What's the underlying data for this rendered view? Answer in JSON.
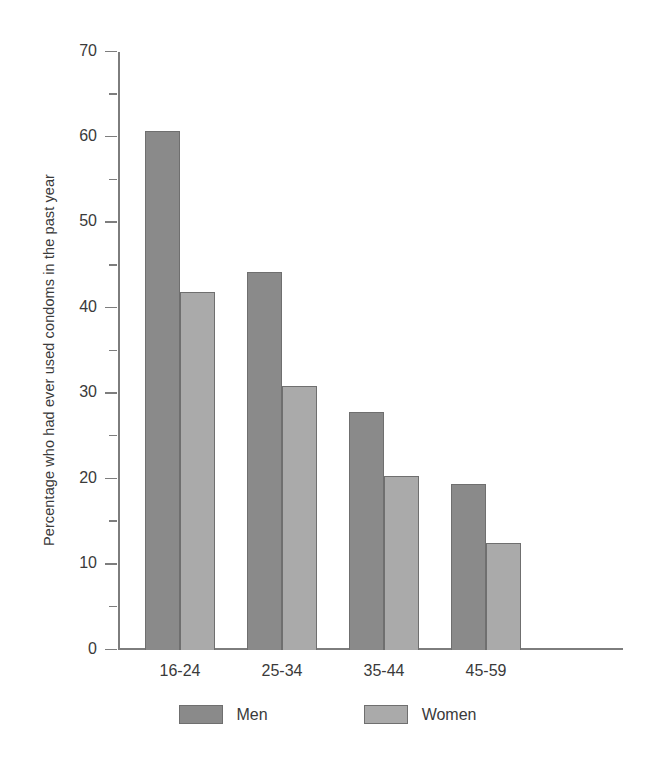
{
  "chart_data": {
    "type": "bar",
    "title": "",
    "subtitle": "",
    "xlabel": "",
    "ylabel": "Percentage who had ever used condoms in the past year",
    "ylim": [
      0,
      70
    ],
    "y_major_step": 10,
    "y_minor_step": 5,
    "grid": false,
    "legend_position": "bottom",
    "categories": [
      "16-24",
      "25-34",
      "35-44",
      "45-59",
      "All ages"
    ],
    "series": [
      {
        "name": "Men",
        "color": "#8a8a8a",
        "values": [
          60.8,
          44.3,
          27.9,
          19.4,
          36.6
        ]
      },
      {
        "name": "Women",
        "color": "#aaaaaa",
        "values": [
          41.9,
          30.9,
          20.4,
          12.5,
          25.6
        ]
      }
    ],
    "y_tick_labels": [
      "70",
      "60",
      "50",
      "40",
      "30",
      "20",
      "10",
      "0"
    ],
    "y_tick_values": [
      70,
      60,
      50,
      40,
      30,
      20,
      10,
      0
    ],
    "y_minor_tick_values": [
      65,
      55,
      45,
      35,
      25,
      15,
      5
    ]
  }
}
